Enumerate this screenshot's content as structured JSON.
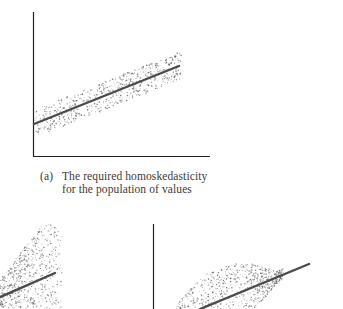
{
  "figure": {
    "panel_a": {
      "label": "(a)",
      "caption_line1": "The required homoskedasticity",
      "caption_line2": "for the population of values"
    }
  },
  "colors": {
    "axis": "#222222",
    "line": "#4a4a4a",
    "dots": "#555555",
    "background": "#ffffff"
  },
  "chart_data": [
    {
      "type": "scatter",
      "title": "(a) The required homoskedasticity for the population of values",
      "description": "Constant-width band of points around a rising regression line",
      "xlabel": "",
      "ylabel": "",
      "grid": false,
      "regression_line": {
        "x": [
          0,
          1
        ],
        "y": [
          0.23,
          0.63
        ]
      },
      "band_halfwidth": 0.1,
      "pixel_geometry": {
        "axis_origin": [
          33,
          156
        ],
        "y_axis_top": 12,
        "x_axis_right": 210,
        "line_start": [
          33,
          124
        ],
        "line_end": [
          179,
          66
        ]
      }
    },
    {
      "type": "scatter",
      "title": "",
      "description": "Heteroskedastic: spread of points widens with x (fan shape), partially cropped",
      "xlabel": "",
      "ylabel": "",
      "grid": false,
      "regression_line": {
        "pixel_start": [
          0,
          298
        ],
        "pixel_end": [
          55,
          273
        ]
      }
    },
    {
      "type": "scatter",
      "title": "",
      "description": "Heteroskedastic: spread of points is wider in middle x range, partially cropped",
      "xlabel": "",
      "ylabel": "",
      "grid": false,
      "regression_line": {
        "pixel_start": [
          200,
          309
        ],
        "pixel_end": [
          309,
          264
        ]
      },
      "pixel_geometry": {
        "y_axis_x": 153,
        "y_axis_top": 224
      }
    }
  ]
}
